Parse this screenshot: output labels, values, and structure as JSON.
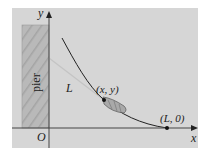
{
  "figure": {
    "panel_color": "#d8d8d8",
    "pier_color": "#b8b8b8",
    "axis_color": "#333333",
    "curve_color": "#222222",
    "labels": {
      "y_axis": "y",
      "x_axis": "x",
      "origin": "O",
      "pier": "pier",
      "rope_length": "L",
      "boat_point": "(x, y)",
      "endpoint": "(L, 0)"
    }
  }
}
